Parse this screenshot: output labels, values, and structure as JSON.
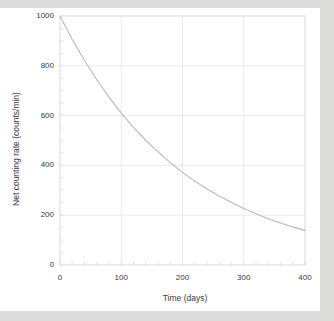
{
  "chart_data": {
    "type": "line",
    "title": "",
    "xlabel": "Time (days)",
    "ylabel": "Net counting rate (counts/min)",
    "xlim": [
      0,
      400
    ],
    "ylim": [
      0,
      1000
    ],
    "xticks": [
      0,
      100,
      200,
      300,
      400
    ],
    "yticks": [
      0,
      200,
      400,
      600,
      800,
      1000
    ],
    "x_minor_interval": 20,
    "y_minor_interval": 50,
    "grid": true,
    "legend": null,
    "series": [
      {
        "name": "Net counting rate",
        "x": [
          0,
          20,
          40,
          60,
          80,
          100,
          120,
          140,
          160,
          180,
          200,
          220,
          240,
          260,
          280,
          300,
          320,
          340,
          360,
          380,
          400
        ],
        "values": [
          1000,
          906,
          821,
          744,
          674,
          610,
          553,
          501,
          454,
          411,
          372,
          337,
          305,
          277,
          251,
          227,
          206,
          186,
          169,
          153,
          139
        ]
      }
    ],
    "curve_model": "N(t) = 1000 * exp(-0.00495 * t)",
    "colors": {
      "curve": "#b9b9b9",
      "grid": "#e6e6e6",
      "axis": "#c8c8c8",
      "text": "#3a3a3a",
      "plot_background": "#ffffff",
      "page_background": "#dcdcda"
    }
  }
}
